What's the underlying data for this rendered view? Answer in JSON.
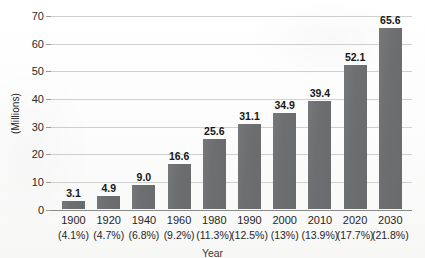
{
  "chart_data": {
    "type": "bar",
    "title": "",
    "xlabel": "Year",
    "ylabel": "(Millions)",
    "ylim": [
      0,
      70
    ],
    "yticks": [
      "0",
      "10",
      "20",
      "30",
      "40",
      "50",
      "60",
      "70"
    ],
    "grid": true,
    "legend": "none",
    "categories": [
      "1900",
      "1920",
      "1940",
      "1960",
      "1980",
      "1990",
      "2000",
      "2010",
      "2020",
      "2030"
    ],
    "values": [
      3.1,
      4.9,
      9.0,
      16.6,
      25.6,
      31.1,
      34.9,
      39.4,
      52.1,
      65.6
    ],
    "value_labels": [
      "3.1",
      "4.9",
      "9.0",
      "16.6",
      "25.6",
      "31.1",
      "34.9",
      "39.4",
      "52.1",
      "65.6"
    ],
    "percent_labels": [
      "(4.1%)",
      "(4.7%)",
      "(6.8%)",
      "(9.2%)",
      "(11.3%)",
      "(12.5%)",
      "(13%)",
      "(13.9%)",
      "(17.7%)",
      "(21.8%)"
    ],
    "bar_color": "#6d6e70",
    "gridline_color": "#cfcfcf",
    "axis_color": "#8a8a8a",
    "background_color": "#fdfdfd"
  }
}
